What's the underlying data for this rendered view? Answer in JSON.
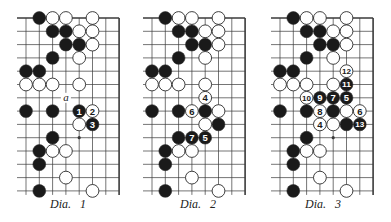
{
  "colors": {
    "background": "#ffffff",
    "line": "#3a3a3a",
    "black_stone": "#1a1a1a",
    "white_stone": "#ffffff",
    "stone_outline": "#2a2a2a",
    "label_on_black": "#ffffff",
    "label_on_white": "#1a1a1a"
  },
  "board": {
    "cols": 8,
    "rows": 14,
    "spacing": 13.3,
    "stone_radius": 6.4,
    "top_edge": true,
    "right_edge": true,
    "hoshi": [
      [
        4,
        9
      ]
    ]
  },
  "diagrams": [
    {
      "id": "dia-1",
      "caption": "Dia.   1",
      "origin_x": 26,
      "caption_x": 50,
      "stones": [
        {
          "c": 1,
          "r": 0,
          "color": "B"
        },
        {
          "c": 2,
          "r": 0,
          "color": "W"
        },
        {
          "c": 3,
          "r": 0,
          "color": "W"
        },
        {
          "c": 5,
          "r": 0,
          "color": "W"
        },
        {
          "c": 2,
          "r": 1,
          "color": "B"
        },
        {
          "c": 3,
          "r": 1,
          "color": "B"
        },
        {
          "c": 4,
          "r": 1,
          "color": "W"
        },
        {
          "c": 5,
          "r": 1,
          "color": "W"
        },
        {
          "c": 3,
          "r": 2,
          "color": "B"
        },
        {
          "c": 4,
          "r": 2,
          "color": "B"
        },
        {
          "c": 5,
          "r": 2,
          "color": "W"
        },
        {
          "c": 2,
          "r": 3,
          "color": "B"
        },
        {
          "c": 4,
          "r": 3,
          "color": "W"
        },
        {
          "c": 0,
          "r": 4,
          "color": "B"
        },
        {
          "c": 1,
          "r": 4,
          "color": "B"
        },
        {
          "c": 0,
          "r": 5,
          "color": "W"
        },
        {
          "c": 1,
          "r": 5,
          "color": "W"
        },
        {
          "c": 2,
          "r": 5,
          "color": "W"
        },
        {
          "c": 4,
          "r": 5,
          "color": "W"
        },
        {
          "c": 0,
          "r": 7,
          "color": "B"
        },
        {
          "c": 2,
          "r": 7,
          "color": "B"
        },
        {
          "c": 4,
          "r": 7,
          "color": "B",
          "label": "1"
        },
        {
          "c": 5,
          "r": 7,
          "color": "W",
          "label": "2"
        },
        {
          "c": 4,
          "r": 8,
          "color": "W"
        },
        {
          "c": 5,
          "r": 8,
          "color": "B",
          "label": "3"
        },
        {
          "c": 2,
          "r": 9,
          "color": "B"
        },
        {
          "c": 1,
          "r": 10,
          "color": "B"
        },
        {
          "c": 2,
          "r": 10,
          "color": "W"
        },
        {
          "c": 3,
          "r": 10,
          "color": "W"
        },
        {
          "c": 1,
          "r": 11,
          "color": "B"
        },
        {
          "c": 3,
          "r": 12,
          "color": "W"
        },
        {
          "c": 1,
          "r": 13,
          "color": "B"
        },
        {
          "c": 5,
          "r": 13,
          "color": "W"
        }
      ],
      "marks": [
        {
          "c": 3,
          "r": 6,
          "text": "a"
        }
      ]
    },
    {
      "id": "dia-2",
      "caption": "Dia.   2",
      "origin_x": 152,
      "caption_x": 180,
      "stones": [
        {
          "c": 1,
          "r": 0,
          "color": "B"
        },
        {
          "c": 2,
          "r": 0,
          "color": "W"
        },
        {
          "c": 3,
          "r": 0,
          "color": "W"
        },
        {
          "c": 5,
          "r": 0,
          "color": "W"
        },
        {
          "c": 2,
          "r": 1,
          "color": "B"
        },
        {
          "c": 3,
          "r": 1,
          "color": "B"
        },
        {
          "c": 4,
          "r": 1,
          "color": "W"
        },
        {
          "c": 5,
          "r": 1,
          "color": "W"
        },
        {
          "c": 3,
          "r": 2,
          "color": "B"
        },
        {
          "c": 4,
          "r": 2,
          "color": "B"
        },
        {
          "c": 5,
          "r": 2,
          "color": "W"
        },
        {
          "c": 2,
          "r": 3,
          "color": "B"
        },
        {
          "c": 4,
          "r": 3,
          "color": "W"
        },
        {
          "c": 0,
          "r": 4,
          "color": "B"
        },
        {
          "c": 1,
          "r": 4,
          "color": "B"
        },
        {
          "c": 0,
          "r": 5,
          "color": "W"
        },
        {
          "c": 1,
          "r": 5,
          "color": "W"
        },
        {
          "c": 2,
          "r": 5,
          "color": "W"
        },
        {
          "c": 4,
          "r": 5,
          "color": "W"
        },
        {
          "c": 4,
          "r": 6,
          "color": "W",
          "label": "4"
        },
        {
          "c": 0,
          "r": 7,
          "color": "B"
        },
        {
          "c": 2,
          "r": 7,
          "color": "B"
        },
        {
          "c": 3,
          "r": 7,
          "color": "W",
          "label": "6"
        },
        {
          "c": 4,
          "r": 7,
          "color": "B"
        },
        {
          "c": 5,
          "r": 7,
          "color": "W"
        },
        {
          "c": 4,
          "r": 8,
          "color": "W"
        },
        {
          "c": 5,
          "r": 8,
          "color": "B"
        },
        {
          "c": 2,
          "r": 9,
          "color": "B"
        },
        {
          "c": 3,
          "r": 9,
          "color": "B",
          "label": "7"
        },
        {
          "c": 4,
          "r": 9,
          "color": "B",
          "label": "5"
        },
        {
          "c": 1,
          "r": 10,
          "color": "B"
        },
        {
          "c": 2,
          "r": 10,
          "color": "W"
        },
        {
          "c": 3,
          "r": 10,
          "color": "W"
        },
        {
          "c": 1,
          "r": 11,
          "color": "B"
        },
        {
          "c": 3,
          "r": 12,
          "color": "W"
        },
        {
          "c": 1,
          "r": 13,
          "color": "B"
        },
        {
          "c": 5,
          "r": 13,
          "color": "W"
        }
      ],
      "marks": []
    },
    {
      "id": "dia-3",
      "caption": "Dia.   3",
      "origin_x": 280,
      "caption_x": 305,
      "stones": [
        {
          "c": 1,
          "r": 0,
          "color": "B"
        },
        {
          "c": 2,
          "r": 0,
          "color": "W"
        },
        {
          "c": 3,
          "r": 0,
          "color": "W"
        },
        {
          "c": 5,
          "r": 0,
          "color": "W"
        },
        {
          "c": 2,
          "r": 1,
          "color": "B"
        },
        {
          "c": 3,
          "r": 1,
          "color": "B"
        },
        {
          "c": 4,
          "r": 1,
          "color": "W"
        },
        {
          "c": 5,
          "r": 1,
          "color": "W"
        },
        {
          "c": 3,
          "r": 2,
          "color": "B"
        },
        {
          "c": 4,
          "r": 2,
          "color": "B"
        },
        {
          "c": 5,
          "r": 2,
          "color": "W"
        },
        {
          "c": 2,
          "r": 3,
          "color": "B"
        },
        {
          "c": 4,
          "r": 3,
          "color": "W"
        },
        {
          "c": 0,
          "r": 4,
          "color": "B"
        },
        {
          "c": 1,
          "r": 4,
          "color": "B"
        },
        {
          "c": 5,
          "r": 4,
          "color": "W",
          "label": "12"
        },
        {
          "c": 0,
          "r": 5,
          "color": "W"
        },
        {
          "c": 1,
          "r": 5,
          "color": "W"
        },
        {
          "c": 2,
          "r": 5,
          "color": "W"
        },
        {
          "c": 4,
          "r": 5,
          "color": "W"
        },
        {
          "c": 5,
          "r": 5,
          "color": "B",
          "label": "11"
        },
        {
          "c": 2,
          "r": 6,
          "color": "W",
          "label": "10"
        },
        {
          "c": 3,
          "r": 6,
          "color": "B",
          "label": "9"
        },
        {
          "c": 4,
          "r": 6,
          "color": "B",
          "label": "7"
        },
        {
          "c": 5,
          "r": 6,
          "color": "B",
          "label": "5"
        },
        {
          "c": 0,
          "r": 7,
          "color": "B"
        },
        {
          "c": 2,
          "r": 7,
          "color": "B"
        },
        {
          "c": 3,
          "r": 7,
          "color": "W",
          "label": "8"
        },
        {
          "c": 4,
          "r": 7,
          "color": "B"
        },
        {
          "c": 5,
          "r": 7,
          "color": "W"
        },
        {
          "c": 6,
          "r": 7,
          "color": "W",
          "label": "6"
        },
        {
          "c": 3,
          "r": 8,
          "color": "W",
          "label": "4"
        },
        {
          "c": 4,
          "r": 8,
          "color": "W"
        },
        {
          "c": 5,
          "r": 8,
          "color": "B"
        },
        {
          "c": 6,
          "r": 8,
          "color": "B",
          "label": "13"
        },
        {
          "c": 2,
          "r": 9,
          "color": "B"
        },
        {
          "c": 1,
          "r": 10,
          "color": "B"
        },
        {
          "c": 2,
          "r": 10,
          "color": "W"
        },
        {
          "c": 3,
          "r": 10,
          "color": "W"
        },
        {
          "c": 1,
          "r": 11,
          "color": "B"
        },
        {
          "c": 3,
          "r": 12,
          "color": "W"
        },
        {
          "c": 1,
          "r": 13,
          "color": "B"
        },
        {
          "c": 5,
          "r": 13,
          "color": "W"
        }
      ],
      "marks": []
    }
  ]
}
